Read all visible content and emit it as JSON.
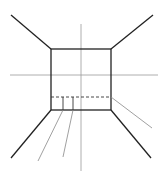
{
  "diagram": {
    "title": "",
    "type": "one-point perspective room",
    "colors": {
      "background": "#ffffff",
      "stroke": "#222222",
      "guide": "#888888"
    },
    "back_wall": {
      "x1": 51,
      "y1": 49,
      "x2": 111,
      "y2": 110
    },
    "horizon_y": 75,
    "center_x": 81,
    "dashed_line_y": 97
  }
}
